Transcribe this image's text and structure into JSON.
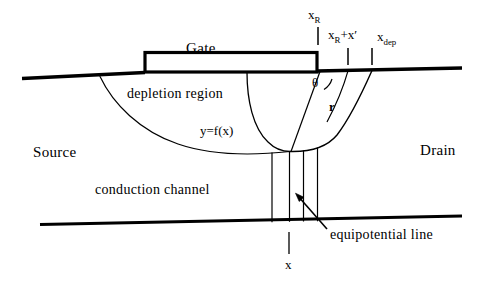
{
  "figure": {
    "width": 494,
    "height": 281,
    "stroke_color": "#000000",
    "background_color": "#ffffff"
  },
  "labels": {
    "gate": "Gate",
    "depletion_region": "depletion region",
    "curve_equation": "y=f(x)",
    "source": "Source",
    "drain": "Drain",
    "conduction_channel": "conduction  channel",
    "equipotential_line": "equipotential  line",
    "theta": "θ",
    "radius": "r",
    "x_bottom": "x"
  },
  "axis_marks": {
    "x_R": {
      "base": "x",
      "sub": "R",
      "suffix": ""
    },
    "x_R_plus_x_prime": {
      "base": "x",
      "sub": "R",
      "suffix": "+x′"
    },
    "x_dep": {
      "base": "x",
      "sub": "dep",
      "suffix": ""
    }
  },
  "tick_positions": {
    "x_R": 318,
    "x_R_plus_x_prime": 348,
    "x_dep": 372,
    "x_bottom": 289
  },
  "equipotential_lines": [
    272,
    289,
    303,
    317
  ]
}
